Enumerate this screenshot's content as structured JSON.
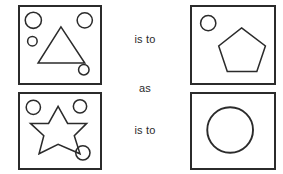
{
  "puzzle": {
    "type": "visual-analogy",
    "relation_labels": {
      "top": "is to",
      "middle": "as",
      "bottom": "is to"
    },
    "colors": {
      "ink": "#2b2b2b",
      "background": "#ffffff"
    },
    "panels": [
      {
        "id": "top-left",
        "position": "top-left",
        "main_shape": "triangle",
        "main_shape_sides": 3,
        "satellite_circles": 4,
        "circle_sizes": [
          "large",
          "large",
          "small",
          "small"
        ],
        "description": "Square frame containing a triangle with four circles around it"
      },
      {
        "id": "top-right",
        "position": "top-right",
        "main_shape": "pentagon",
        "main_shape_sides": 5,
        "satellite_circles": 1,
        "circle_sizes": [
          "medium"
        ],
        "description": "Square frame containing a pentagon with one circle in the upper left"
      },
      {
        "id": "bottom-left",
        "position": "bottom-left",
        "main_shape": "six-pointed-star",
        "main_shape_points": 6,
        "satellite_circles": 3,
        "circle_sizes": [
          "medium",
          "medium",
          "medium"
        ],
        "description": "Square frame containing a six pointed star with three circles around it"
      },
      {
        "id": "bottom-right",
        "position": "bottom-right",
        "main_shape": "circle",
        "main_shape_sides": 0,
        "satellite_circles": 0,
        "circle_sizes": [],
        "description": "Square frame containing a single large circle"
      }
    ]
  }
}
